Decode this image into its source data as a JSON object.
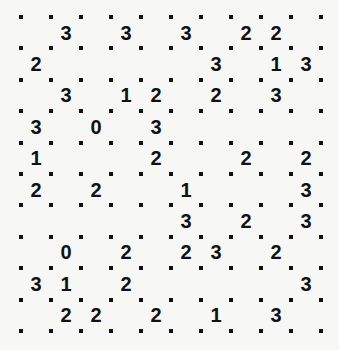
{
  "puzzle": {
    "type": "slitherlink",
    "rows": 10,
    "cols": 10,
    "clues": [
      [
        "",
        "3",
        "",
        "3",
        "",
        "3",
        "",
        "2",
        "2",
        ""
      ],
      [
        "2",
        "",
        "",
        "",
        "",
        "",
        "3",
        "",
        "1",
        "3"
      ],
      [
        "",
        "3",
        "",
        "1",
        "2",
        "",
        "2",
        "",
        "3",
        ""
      ],
      [
        "3",
        "",
        "0",
        "",
        "3",
        "",
        "",
        "",
        "",
        ""
      ],
      [
        "1",
        "",
        "",
        "",
        "2",
        "",
        "",
        "2",
        "",
        "2"
      ],
      [
        "2",
        "",
        "2",
        "",
        "",
        "1",
        "",
        "",
        "",
        "3"
      ],
      [
        "",
        "",
        "",
        "",
        "",
        "3",
        "",
        "2",
        "",
        "3"
      ],
      [
        "",
        "0",
        "",
        "2",
        "",
        "2",
        "3",
        "",
        "2",
        ""
      ],
      [
        "3",
        "1",
        "",
        "2",
        "",
        "",
        "",
        "",
        "",
        "3"
      ],
      [
        "",
        "2",
        "2",
        "",
        "2",
        "",
        "1",
        "",
        "3",
        ""
      ]
    ]
  },
  "layout": {
    "origin_x": 21,
    "origin_y": 17,
    "cell_w": 30,
    "cell_h": 31.4
  },
  "colors": {
    "background": "#f7f7f6",
    "ink": "#111111"
  }
}
